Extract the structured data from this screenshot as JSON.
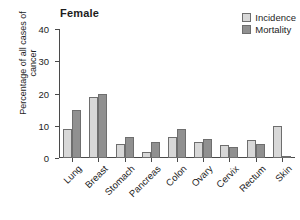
{
  "chart_data": {
    "type": "bar",
    "title": "Female",
    "xlabel": "",
    "ylabel": "Percentage of all cases of cancer",
    "ylim": [
      0,
      40
    ],
    "yticks": [
      0,
      10,
      20,
      30,
      40
    ],
    "grid": false,
    "legend_position": "top-right",
    "categories": [
      "Lung",
      "Breast",
      "Stomach",
      "Pancreas",
      "Colon",
      "Ovary",
      "Cervix",
      "Rectum",
      "Skin"
    ],
    "series": [
      {
        "name": "Incidence",
        "color": "#d8d8d8",
        "values": [
          9,
          19,
          4.5,
          2,
          6.5,
          5,
          4,
          5.5,
          10
        ]
      },
      {
        "name": "Mortality",
        "color": "#909090",
        "values": [
          15,
          20,
          6.5,
          5,
          9,
          6,
          3.5,
          4.5,
          0.3
        ]
      }
    ]
  },
  "legend": {
    "items": [
      {
        "label": "Incidence",
        "swatch_color": "#d8d8d8"
      },
      {
        "label": "Mortality",
        "swatch_color": "#909090"
      }
    ]
  },
  "axes": {
    "y_title": "Percentage of all cases of cancer",
    "y_tick_labels": [
      "0",
      "10",
      "20",
      "30",
      "40"
    ]
  }
}
